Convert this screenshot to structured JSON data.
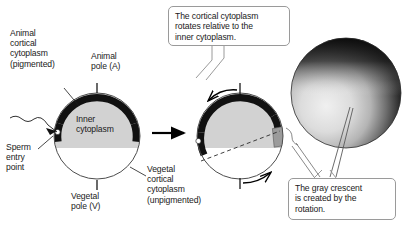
{
  "figure": {
    "background_color": "#ffffff",
    "text_color": "#1a1a1a"
  },
  "labels": {
    "animal_cortical_cytoplasm": "Animal\ncortical\ncytoplasm\n(pigmented)",
    "animal_pole": "Animal\npole (A)",
    "inner_cytoplasm": "Inner\ncytoplasm",
    "sperm_entry_point": "Sperm\nentry\npoint",
    "vegetal_pole": "Vegetal\npole (V)",
    "vegetal_cortical_cytoplasm": "Vegetal\ncortical\ncytoplasm\n(unpigmented)"
  },
  "callouts": {
    "top": "The cortical cytoplasm\nrotates relative to the\ninner cytoplasm.",
    "bottom": "The gray crescent\nis created by the\nrotation."
  },
  "colors": {
    "pigmented_cortex": "#111111",
    "inner_cytoplasm": "#d2d2d2",
    "vegetal_cytoplasm": "#ffffff",
    "gray_crescent": "#9b9b9b",
    "outline": "#4d4d4d",
    "callout_border": "#9a9a9a",
    "arrow": "#000000",
    "photo_dark": "#0c0c0c",
    "photo_light": "#e8e8e8"
  },
  "diagrams": [
    {
      "name": "egg-before-rotation",
      "cx": 97,
      "cy": 136,
      "r": 43,
      "pigmented_band_start_deg": 188,
      "pigmented_band_end_deg": 352,
      "sperm_entry_dot": true,
      "sperm_entry_dot_angle_deg": 195,
      "gray_crescent": false
    },
    {
      "name": "egg-after-rotation",
      "cx": 240,
      "cy": 136,
      "r": 43,
      "pigmented_band_start_deg": 175,
      "pigmented_band_end_deg": 338,
      "sperm_entry_dot": true,
      "sperm_entry_dot_angle_deg": 185,
      "gray_crescent": true,
      "rotation_arrows": [
        "counterclockwise-top",
        "clockwise-bottom"
      ],
      "dashed_axis": true
    }
  ],
  "photo": {
    "name": "gray-crescent-photograph",
    "cx": 346,
    "cy": 93,
    "r": 55,
    "description": "Photomicrograph of an amphibian egg showing the gray crescent"
  },
  "transition_arrow": {
    "from_x": 152,
    "from_y": 133,
    "to_x": 186,
    "to_y": 133
  }
}
